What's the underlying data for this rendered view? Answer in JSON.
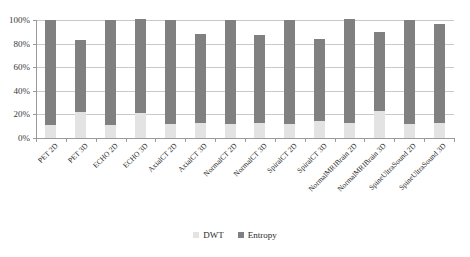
{
  "chart_data": {
    "type": "bar",
    "subtype": "stacked-bar",
    "title": "",
    "xlabel": "",
    "ylabel": "",
    "ylim": [
      0,
      100
    ],
    "ytick_labels": [
      "100%",
      "80%",
      "60%",
      "40%",
      "20%",
      "0%"
    ],
    "yticks": [
      100,
      80,
      60,
      40,
      20,
      0
    ],
    "grid": true,
    "legend_position": "bottom",
    "categories": [
      "PET 2D",
      "PET 3D",
      "ECHO 2D",
      "ECHO 3D",
      "AxialCT 2D",
      "AxialCT 3D",
      "NormalCT 2D",
      "NormalCT 3D",
      "SpiralCT 2D",
      "SpiralCT 3D",
      "NormalMRIBrain 2D",
      "NormalMRIBrain 3D",
      "SpineUltraSound 2D",
      "SpineUltraSound 3D"
    ],
    "series": [
      {
        "name": "DWT",
        "color": "#e3e3e3",
        "values": [
          11,
          22,
          11,
          21,
          12,
          13,
          12,
          13,
          12,
          14,
          13,
          23,
          12,
          13
        ]
      },
      {
        "name": "Entropy",
        "color": "#808080",
        "values": [
          89,
          61,
          89,
          80,
          88,
          75,
          88,
          74,
          88,
          70,
          88,
          67,
          88,
          84
        ]
      }
    ],
    "totals": [
      100,
      83,
      100,
      101,
      100,
      88,
      100,
      87,
      100,
      84,
      101,
      90,
      100,
      97
    ]
  },
  "legend": {
    "items": [
      {
        "label": "DWT",
        "swatch": "dwt"
      },
      {
        "label": "Entropy",
        "swatch": "entropy"
      }
    ]
  }
}
